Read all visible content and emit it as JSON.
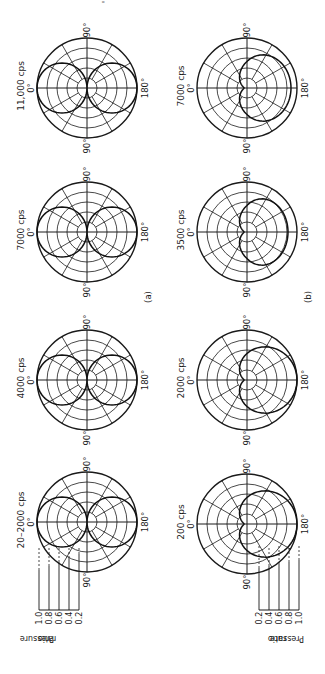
{
  "figure": {
    "orientation": "rotated-90-clockwise",
    "page_mark": "'"
  },
  "rows": [
    {
      "label": "(a)",
      "plots": [
        {
          "title": "20–2000 cps",
          "pattern": "figure-eight",
          "rear_scale": 1.0,
          "angle_labels": {
            "zero": "0°",
            "ninety_a": "90°",
            "ninety_b": "90°",
            "one_eighty": "180°"
          }
        },
        {
          "title": "4000 cps",
          "pattern": "figure-eight",
          "rear_scale": 1.0,
          "angle_labels": {
            "zero": "0°",
            "ninety_a": "90°",
            "ninety_b": "90°",
            "one_eighty": "180°"
          }
        },
        {
          "title": "7000 cps",
          "pattern": "figure-eight",
          "rear_scale": 1.0,
          "angle_labels": {
            "zero": "0°",
            "ninety_a": "90°",
            "ninety_b": "90°",
            "one_eighty": "180°"
          }
        },
        {
          "title": "11,000 cps",
          "pattern": "figure-eight",
          "rear_scale": 1.0,
          "angle_labels": {
            "zero": "0°",
            "ninety_a": "90°",
            "ninety_b": "90°",
            "one_eighty": "180°"
          }
        }
      ]
    },
    {
      "label": "(b)",
      "plots": [
        {
          "title": "200 cps",
          "pattern": "cardioid-rear",
          "rear_scale": 1.0,
          "angle_labels": {
            "zero": "0°",
            "ninety_a": "90°",
            "ninety_b": "90°",
            "one_eighty": "180°"
          }
        },
        {
          "title": "2000 cps",
          "pattern": "cardioid-rear",
          "rear_scale": 1.0,
          "angle_labels": {
            "zero": "0°",
            "ninety_a": "90°",
            "ninety_b": "90°",
            "one_eighty": "180°"
          }
        },
        {
          "title": "3500 cps",
          "pattern": "cardioid-rear",
          "rear_scale": 0.82,
          "angle_labels": {
            "zero": "0°",
            "ninety_a": "90°",
            "ninety_b": "90°",
            "one_eighty": "180°"
          }
        },
        {
          "title": "7000 cps",
          "pattern": "cardioid-rear",
          "rear_scale": 0.88,
          "angle_labels": {
            "zero": "0°",
            "ninety_a": "90°",
            "ninety_b": "90°",
            "one_eighty": "180°"
          }
        }
      ]
    }
  ],
  "scale": {
    "axis_label_line1": "Pressure",
    "axis_label_line2": "ratio",
    "ticks": [
      "0.2",
      "0.4",
      "0.6",
      "0.8",
      "1.0"
    ]
  },
  "chart_data": {
    "type": "polar",
    "radial_axis": {
      "label": "Pressure ratio",
      "ticks": [
        0.2,
        0.4,
        0.6,
        0.8,
        1.0
      ],
      "range": [
        0,
        1.0
      ]
    },
    "angular_ticks": [
      "0°",
      "90°",
      "180°",
      "90°"
    ],
    "panels": [
      {
        "group": "(a)",
        "frequency": "20–2000 cps",
        "pattern": "bidirectional (figure-eight)",
        "front_max": 1.0,
        "rear_max": 1.0,
        "at_90": 0.0
      },
      {
        "group": "(a)",
        "frequency": "4000 cps",
        "pattern": "bidirectional (figure-eight)",
        "front_max": 1.0,
        "rear_max": 1.0,
        "at_90": 0.0
      },
      {
        "group": "(a)",
        "frequency": "7000 cps",
        "pattern": "bidirectional (figure-eight)",
        "front_max": 1.0,
        "rear_max": 1.0,
        "at_90": 0.0
      },
      {
        "group": "(a)",
        "frequency": "11,000 cps",
        "pattern": "bidirectional (figure-eight)",
        "front_max": 1.0,
        "rear_max": 1.0,
        "at_90": 0.0
      },
      {
        "group": "(b)",
        "frequency": "200 cps",
        "pattern": "unidirectional (cardioid, max at 180°)",
        "at_180": 1.0,
        "at_90": 0.5,
        "at_0": 0.1
      },
      {
        "group": "(b)",
        "frequency": "2000 cps",
        "pattern": "unidirectional (cardioid, max at 180°)",
        "at_180": 1.0,
        "at_90": 0.5,
        "at_0": 0.05
      },
      {
        "group": "(b)",
        "frequency": "3500 cps",
        "pattern": "unidirectional (cardioid, max at 180°)",
        "at_180": 1.0,
        "at_90": 0.42,
        "at_0": 0.05
      },
      {
        "group": "(b)",
        "frequency": "7000 cps",
        "pattern": "unidirectional (cardioid, max at 180°)",
        "at_180": 1.0,
        "at_90": 0.45,
        "at_0": 0.05
      }
    ]
  }
}
